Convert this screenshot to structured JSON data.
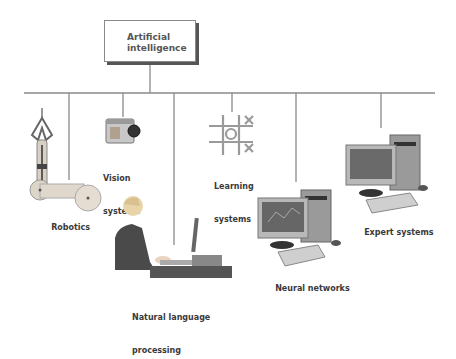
{
  "diagram": {
    "root": {
      "label_line1": "Artificial",
      "label_line2": "intelligence"
    },
    "branches": [
      {
        "id": "robotics",
        "label": "Robotics",
        "icon": "robot-arm-icon"
      },
      {
        "id": "vision",
        "label_line1": "Vision",
        "label_line2": "systems",
        "icon": "camera-icon"
      },
      {
        "id": "nlp",
        "label_line1": "Natural language",
        "label_line2": "processing",
        "icon": "person-at-computer-icon"
      },
      {
        "id": "learning",
        "label_line1": "Learning",
        "label_line2": "systems",
        "icon": "tic-tac-toe-icon"
      },
      {
        "id": "neural",
        "label": "Neural networks",
        "icon": "desktop-computer-icon"
      },
      {
        "id": "expert",
        "label": "Expert systems",
        "icon": "desktop-computer-icon"
      }
    ],
    "colors": {
      "line": "#8a8a8a",
      "text": "#3a3a3a",
      "shadow": "#555555"
    }
  }
}
